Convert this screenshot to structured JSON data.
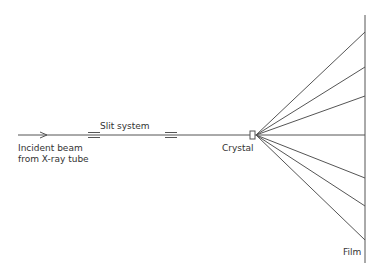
{
  "diagram": {
    "labels": {
      "incident_line1": "Incident beam",
      "incident_line2": "from X-ray tube",
      "slit_system": "Slit system",
      "crystal": "Crystal",
      "film": "Film"
    },
    "components": [
      "incident-beam",
      "slit-1",
      "slit-2",
      "crystal",
      "film"
    ],
    "diffracted_ray_count": 7,
    "colors": {
      "line": "#555555",
      "text": "#333333",
      "background": "#ffffff"
    }
  }
}
